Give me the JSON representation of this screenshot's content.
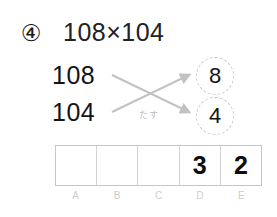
{
  "problem": {
    "number_label": "④",
    "expression": "108×104"
  },
  "operands": {
    "top": "108",
    "bottom": "104"
  },
  "cross": {
    "label": "たす",
    "arrow_color": "#c2c2c2"
  },
  "results": [
    {
      "name": "upper-result",
      "value": "8"
    },
    {
      "name": "lower-result",
      "value": "4"
    }
  ],
  "answer_grid": {
    "cells": [
      "",
      "",
      "",
      "3",
      "2"
    ],
    "labels": [
      "A",
      "B",
      "C",
      "D",
      "E"
    ],
    "border_color": "#c6c6c6"
  }
}
